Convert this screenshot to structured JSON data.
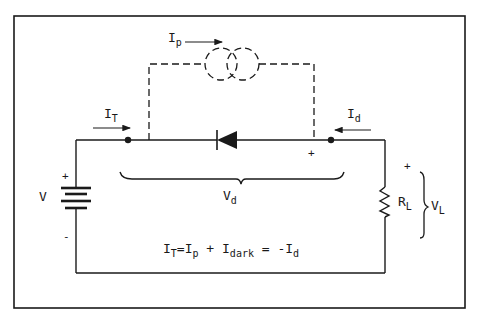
{
  "diagram": {
    "type": "circuit-schematic",
    "colors": {
      "line": "#1a1a1a",
      "background": "#ffffff"
    },
    "labels": {
      "photocurrent": {
        "main": "I",
        "sub": "p"
      },
      "total_current": {
        "main": "I",
        "sub": "T"
      },
      "diode_current": {
        "main": "I",
        "sub": "d"
      },
      "diode_voltage": {
        "main": "V",
        "sub": "d"
      },
      "source_voltage": "V",
      "load_resistor": {
        "main": "R",
        "sub": "L"
      },
      "load_voltage": {
        "main": "V",
        "sub": "L"
      },
      "plus": "+",
      "minus": "-"
    },
    "equation": {
      "p1": "I",
      "s1": "T",
      "p2": "=I",
      "s2": "p",
      "p3": " + I",
      "s3": "dark",
      "p4": " = -I",
      "s4": "d"
    },
    "components": [
      {
        "name": "current-source",
        "label": "Ip",
        "style": "dashed"
      },
      {
        "name": "photodiode",
        "orientation": "cathode-left"
      },
      {
        "name": "battery",
        "label": "V"
      },
      {
        "name": "load-resistor",
        "label": "RL"
      }
    ]
  }
}
